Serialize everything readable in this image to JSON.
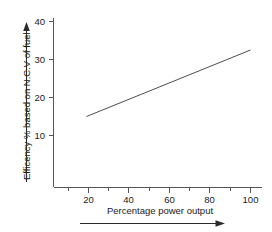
{
  "chart_data": {
    "type": "line",
    "title": "",
    "subtitle": "",
    "xlabel": "Percentage power output",
    "ylabel": "Efficency % based on N.C.V of fuel",
    "xlim": [
      0,
      104
    ],
    "ylim": [
      0,
      42
    ],
    "xticks": [
      20,
      40,
      60,
      80,
      100
    ],
    "xtick_labels": [
      "20",
      "40",
      "60",
      "80",
      "100"
    ],
    "xminor_ticks": [
      10,
      30,
      50,
      70,
      90
    ],
    "yticks": [
      10,
      20,
      30,
      40
    ],
    "ytick_labels": [
      "10",
      "20",
      "30",
      "40"
    ],
    "grid": false,
    "legend": "none",
    "series": [
      {
        "name": "Efficiency vs power output",
        "x": [
          19,
          100
        ],
        "values": [
          15,
          32.5
        ]
      }
    ],
    "annotations": [
      {
        "name": "x-axis-direction-arrow",
        "orientation": "right",
        "description": "horizontal arrow beneath the x-axis title"
      },
      {
        "name": "y-axis-direction-arrow",
        "orientation": "up",
        "description": "vertical arrow beside the y-axis title"
      }
    ]
  },
  "labels": {
    "y_axis_title": "Efficency % based on N.C.V of fuel",
    "x_axis_title": "Percentage power output",
    "y_tick_40": "40",
    "y_tick_30": "30",
    "y_tick_20": "20",
    "y_tick_10": "10",
    "x_tick_20": "20",
    "x_tick_40": "40",
    "x_tick_60": "60",
    "x_tick_80": "80",
    "x_tick_100": "100"
  },
  "colors": {
    "background": "#ffffff",
    "axis": "#555555",
    "series": "#4d4d4d",
    "text": "#1a1a1a",
    "arrow": "#2b2b2b"
  }
}
